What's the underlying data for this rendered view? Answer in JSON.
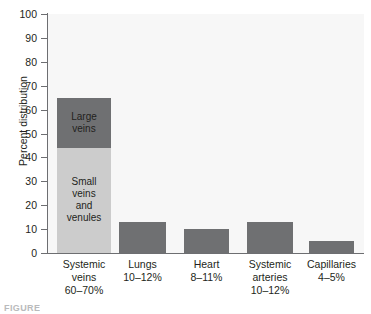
{
  "chart_data": {
    "type": "bar",
    "title": "",
    "xlabel": "",
    "ylabel": "Percent distribution",
    "ylim": [
      0,
      100
    ],
    "ytick_values": [
      100,
      90,
      80,
      70,
      60,
      50,
      40,
      30,
      20,
      10,
      0
    ],
    "ytick_labels": [
      "100",
      "90",
      "80",
      "70",
      "60",
      "50",
      "40",
      "30",
      "20",
      "10",
      "0"
    ],
    "grid": false,
    "legend": "none",
    "stacked": true,
    "categories": [
      "Systemic veins 60–70%",
      "Lungs 10–12%",
      "Heart 8–11%",
      "Systemic arteries 10–12%",
      "Capillaries 4–5%"
    ],
    "series": [
      {
        "name": "Small veins and venules",
        "color": "#cccccc",
        "values": [
          44,
          0,
          0,
          0,
          0
        ]
      },
      {
        "name": "Large veins",
        "color": "#6f7072",
        "values": [
          21,
          13,
          10,
          13,
          5
        ]
      }
    ],
    "bar_totals": [
      65,
      13,
      10,
      13,
      5
    ],
    "annotations": [
      {
        "text": "Large veins",
        "category": "Systemic veins 60–70%",
        "segment": "Large veins"
      },
      {
        "text": "Small veins and venules",
        "category": "Systemic veins 60–70%",
        "segment": "Small veins and venules"
      }
    ]
  },
  "axis": {
    "y_title": "Percent distribution",
    "ticks": [
      "100",
      "90",
      "80",
      "70",
      "60",
      "50",
      "40",
      "30",
      "20",
      "10",
      "0"
    ]
  },
  "bars": [
    {
      "name": "systemic-veins",
      "segments": [
        {
          "label": "Large\nveins",
          "value": 21,
          "base": 44,
          "tone": "dark"
        },
        {
          "label": "Small\nveins\nand\nvenules",
          "value": 44,
          "base": 0,
          "tone": "light"
        }
      ],
      "category_label": "Systemic\nveins\n60–70%"
    },
    {
      "name": "lungs",
      "segments": [
        {
          "label": "",
          "value": 13,
          "base": 0,
          "tone": "dark"
        }
      ],
      "category_label": "Lungs\n10–12%"
    },
    {
      "name": "heart",
      "segments": [
        {
          "label": "",
          "value": 10,
          "base": 0,
          "tone": "dark"
        }
      ],
      "category_label": "Heart\n8–11%"
    },
    {
      "name": "systemic-arteries",
      "segments": [
        {
          "label": "",
          "value": 13,
          "base": 0,
          "tone": "dark"
        }
      ],
      "category_label": "Systemic\narteries\n10–12%"
    },
    {
      "name": "capillaries",
      "segments": [
        {
          "label": "",
          "value": 5,
          "base": 0,
          "tone": "dark"
        }
      ],
      "category_label": "Capillaries\n4–5%"
    }
  ],
  "caption": {
    "text": "FIGURE"
  },
  "colors": {
    "plot_background": "#f7f7f7",
    "axis": "#6d6e71",
    "bar_dark": "#6f7072",
    "bar_light": "#cccccc",
    "text": "#231f20"
  }
}
